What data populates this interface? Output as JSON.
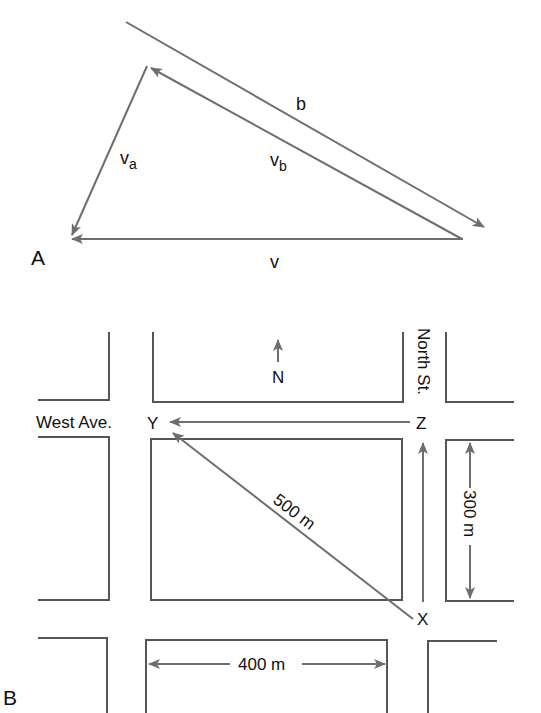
{
  "panel_a": {
    "label": "A",
    "vectors": {
      "b": "b",
      "va_main": "v",
      "va_sub": "a",
      "vb_main": "v",
      "vb_sub": "b",
      "v": "v"
    }
  },
  "panel_b": {
    "label": "B",
    "streets": {
      "west_ave": "West Ave.",
      "north_st": "North St."
    },
    "points": {
      "x": "X",
      "y": "Y",
      "z": "Z"
    },
    "compass": "N",
    "dimensions": {
      "diagonal": "500 m",
      "vertical": "300 m",
      "horizontal": "400 m"
    }
  },
  "colors": {
    "line": "#6e6e6e",
    "block": "#555555",
    "text": "#111111"
  }
}
